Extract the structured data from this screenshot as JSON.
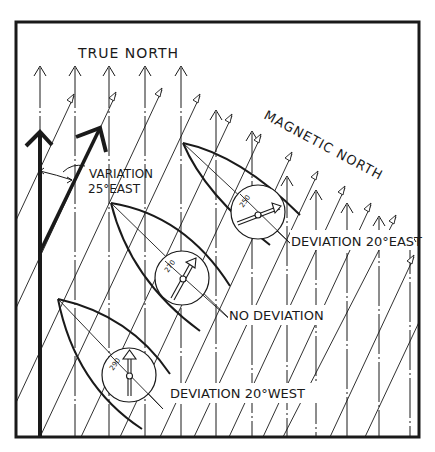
{
  "diagram": {
    "title_true_north": "TRUE NORTH",
    "title_magnetic_north": "MAGNETIC NORTH",
    "variation_label_line1": "VARIATION",
    "variation_label_line2": "25°EAST",
    "boats": [
      {
        "compass_heading": "290",
        "caption": "DEVIATION 20°WEST"
      },
      {
        "compass_heading": "270",
        "caption": "NO DEVIATION"
      },
      {
        "compass_heading": "250",
        "caption": "DEVIATION 20°EAST"
      }
    ],
    "colors": {
      "ink": "#1a1a1a",
      "background": "#ffffff"
    }
  }
}
